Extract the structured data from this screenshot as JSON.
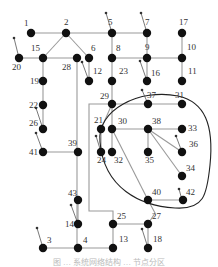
{
  "diagram": {
    "type": "network-graph",
    "nodes": [
      {
        "id": "1",
        "x": 31,
        "y": 33,
        "lx": 24,
        "ly": 26
      },
      {
        "id": "2",
        "x": 66,
        "y": 33,
        "lx": 64,
        "ly": 25
      },
      {
        "id": "5",
        "x": 112,
        "y": 33,
        "lx": 108,
        "ly": 25
      },
      {
        "id": "7",
        "x": 147,
        "y": 33,
        "lx": 145,
        "ly": 25
      },
      {
        "id": "17",
        "x": 182,
        "y": 33,
        "lx": 179,
        "ly": 25
      },
      {
        "id": "20",
        "x": 19,
        "y": 58,
        "lx": 12,
        "ly": 70
      },
      {
        "id": "15",
        "x": 43,
        "y": 58,
        "lx": 31,
        "ly": 51
      },
      {
        "id": "28",
        "x": 77,
        "y": 58,
        "lx": 62,
        "ly": 70
      },
      {
        "id": "6",
        "x": 89,
        "y": 58,
        "lx": 91,
        "ly": 51
      },
      {
        "id": "8",
        "x": 112,
        "y": 58,
        "lx": 116,
        "ly": 51
      },
      {
        "id": "9",
        "x": 147,
        "y": 58,
        "lx": 145,
        "ly": 50
      },
      {
        "id": "10",
        "x": 182,
        "y": 58,
        "lx": 187,
        "ly": 50
      },
      {
        "id": "19",
        "x": 43,
        "y": 81,
        "lx": 30,
        "ly": 84
      },
      {
        "id": "12",
        "x": 89,
        "y": 81,
        "lx": 93,
        "ly": 74
      },
      {
        "id": "23",
        "x": 112,
        "y": 81,
        "lx": 119,
        "ly": 74
      },
      {
        "id": "16",
        "x": 147,
        "y": 81,
        "lx": 151,
        "ly": 76
      },
      {
        "id": "11",
        "x": 182,
        "y": 81,
        "lx": 188,
        "ly": 74
      },
      {
        "id": "22",
        "x": 43,
        "y": 105,
        "lx": 29,
        "ly": 108
      },
      {
        "id": "29",
        "x": 112,
        "y": 104,
        "lx": 100,
        "ly": 99
      },
      {
        "id": "37",
        "x": 148,
        "y": 104,
        "lx": 147,
        "ly": 98
      },
      {
        "id": "31",
        "x": 182,
        "y": 104,
        "lx": 175,
        "ly": 98
      },
      {
        "id": "26",
        "x": 43,
        "y": 129,
        "lx": 29,
        "ly": 126
      },
      {
        "id": "21",
        "x": 101,
        "y": 129,
        "lx": 94,
        "ly": 123
      },
      {
        "id": "30",
        "x": 112,
        "y": 129,
        "lx": 118,
        "ly": 124
      },
      {
        "id": "38",
        "x": 148,
        "y": 129,
        "lx": 152,
        "ly": 124
      },
      {
        "id": "33",
        "x": 182,
        "y": 129,
        "lx": 188,
        "ly": 131
      },
      {
        "id": "41",
        "x": 43,
        "y": 152,
        "lx": 29,
        "ly": 155
      },
      {
        "id": "39",
        "x": 78,
        "y": 152,
        "lx": 68,
        "ly": 146
      },
      {
        "id": "24",
        "x": 101,
        "y": 152,
        "lx": 97,
        "ly": 163
      },
      {
        "id": "32",
        "x": 112,
        "y": 152,
        "lx": 114,
        "ly": 163
      },
      {
        "id": "35",
        "x": 148,
        "y": 152,
        "lx": 145,
        "ly": 163
      },
      {
        "id": "36",
        "x": 182,
        "y": 152,
        "lx": 189,
        "ly": 147
      },
      {
        "id": "34",
        "x": 182,
        "y": 176,
        "lx": 186,
        "ly": 171
      },
      {
        "id": "40",
        "x": 148,
        "y": 200,
        "lx": 152,
        "ly": 195
      },
      {
        "id": "42",
        "x": 183,
        "y": 200,
        "lx": 186,
        "ly": 195
      },
      {
        "id": "43",
        "x": 78,
        "y": 200,
        "lx": 68,
        "ly": 196
      },
      {
        "id": "25",
        "x": 113,
        "y": 224,
        "lx": 117,
        "ly": 219
      },
      {
        "id": "27",
        "x": 148,
        "y": 224,
        "lx": 152,
        "ly": 219
      },
      {
        "id": "14",
        "x": 78,
        "y": 224,
        "lx": 65,
        "ly": 227
      },
      {
        "id": "3",
        "x": 43,
        "y": 248,
        "lx": 47,
        "ly": 243
      },
      {
        "id": "4",
        "x": 78,
        "y": 248,
        "lx": 83,
        "ly": 243
      },
      {
        "id": "13",
        "x": 113,
        "y": 248,
        "lx": 119,
        "ly": 242
      },
      {
        "id": "18",
        "x": 148,
        "y": 248,
        "lx": 153,
        "ly": 242
      }
    ],
    "edges": [
      [
        "1",
        "2"
      ],
      [
        "2",
        "5"
      ],
      [
        "5",
        "7"
      ],
      [
        "2",
        "15"
      ],
      [
        "2",
        "6"
      ],
      [
        "15",
        "20"
      ],
      [
        "15",
        "28"
      ],
      [
        "6",
        "12"
      ],
      [
        "5",
        "8"
      ],
      [
        "8",
        "9"
      ],
      [
        "9",
        "10"
      ],
      [
        "7",
        "9"
      ],
      [
        "17",
        "10"
      ],
      [
        "10",
        "11"
      ],
      [
        "9",
        "16"
      ],
      [
        "8",
        "23"
      ],
      [
        "23",
        "29"
      ],
      [
        "15",
        "19"
      ],
      [
        "19",
        "22"
      ],
      [
        "22",
        "26"
      ],
      [
        "41",
        "39"
      ],
      [
        "29",
        "37"
      ],
      [
        "37",
        "31"
      ],
      [
        "29",
        "30"
      ],
      [
        "30",
        "38"
      ],
      [
        "38",
        "33"
      ],
      [
        "30",
        "32"
      ],
      [
        "21",
        "24"
      ],
      [
        "38",
        "35"
      ],
      [
        "38",
        "36"
      ],
      [
        "38",
        "34"
      ],
      [
        "40",
        "42"
      ],
      [
        "25",
        "27"
      ],
      [
        "25",
        "13"
      ],
      [
        "4",
        "13"
      ],
      [
        "3",
        "4"
      ],
      [
        "43",
        "14"
      ],
      [
        "27",
        "18"
      ]
    ],
    "polylines": [
      [
        [
          77,
          58
        ],
        [
          77,
          248
        ]
      ],
      [
        [
          0,
          104
        ],
        [
          0,
          104
        ]
      ],
      [
        [
          112,
          104
        ],
        [
          89,
          104
        ],
        [
          89,
          211
        ],
        [
          113,
          211
        ],
        [
          113,
          224
        ]
      ],
      [
        [
          112,
          129
        ],
        [
          148,
          200
        ]
      ],
      [
        [
          101,
          129
        ],
        [
          112,
          104
        ]
      ],
      [
        [
          148,
          200
        ],
        [
          155,
          213
        ],
        [
          148,
          224
        ]
      ]
    ],
    "arrows": [
      {
        "from": [
          19,
          58
        ],
        "to": [
          14,
          38
        ]
      },
      {
        "from": [
          112,
          33
        ],
        "to": [
          106,
          13
        ]
      },
      {
        "from": [
          147,
          33
        ],
        "to": [
          141,
          13
        ]
      },
      {
        "from": [
          147,
          81
        ],
        "to": [
          140,
          61
        ]
      },
      {
        "from": [
          89,
          81
        ],
        "to": [
          82,
          62
        ]
      },
      {
        "from": [
          43,
          129
        ],
        "to": [
          36,
          108
        ]
      },
      {
        "from": [
          43,
          152
        ],
        "to": [
          36,
          133
        ]
      },
      {
        "from": [
          148,
          104
        ],
        "to": [
          142,
          90
        ]
      },
      {
        "from": [
          182,
          152
        ],
        "to": [
          176,
          136
        ]
      },
      {
        "from": [
          182,
          200
        ],
        "to": [
          179,
          189
        ]
      },
      {
        "from": [
          78,
          224
        ],
        "to": [
          71,
          205
        ]
      },
      {
        "from": [
          43,
          248
        ],
        "to": [
          37,
          228
        ]
      },
      {
        "from": [
          148,
          248
        ],
        "to": [
          142,
          229
        ]
      },
      {
        "from": [
          101,
          152
        ],
        "to": [
          96,
          136
        ]
      }
    ],
    "region_path": "M 100 142 C 96 110, 140 88, 178 96 C 205 102, 214 125, 210 165 C 207 195, 204 210, 175 208 C 140 206, 104 188, 100 142 Z",
    "caption": "图 … 系统网络结构 … 节点分区"
  }
}
